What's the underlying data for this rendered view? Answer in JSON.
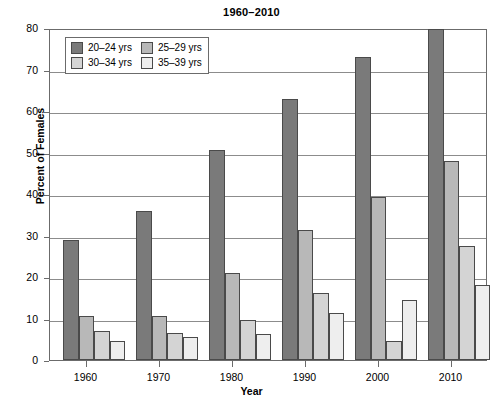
{
  "chart_data": {
    "type": "bar",
    "title": "1960–2010",
    "xlabel": "Year",
    "ylabel": "Percent of Females",
    "categories": [
      "1960",
      "1970",
      "1980",
      "1990",
      "2000",
      "2010"
    ],
    "ylim": [
      0,
      80
    ],
    "yticks": [
      "0",
      "10",
      "20",
      "30",
      "40",
      "50",
      "60",
      "70",
      "80"
    ],
    "grid": "horizontal",
    "legend_position": "top-left inside plot",
    "series": [
      {
        "name": "20–24 yrs",
        "color": "#7a7a7a",
        "values": [
          29,
          36,
          50.5,
          63,
          73,
          79.8
        ]
      },
      {
        "name": "25–29 yrs",
        "color": "#b8b8b8",
        "values": [
          10.5,
          10.5,
          21,
          31.3,
          39.2,
          48
        ]
      },
      {
        "name": "30–34 yrs",
        "color": "#d4d4d4",
        "values": [
          7,
          6.5,
          9.7,
          16.2,
          4.5,
          27.5
        ]
      },
      {
        "name": "35–39 yrs",
        "color": "#eeeeee",
        "values": [
          4.5,
          5.5,
          6.3,
          11.3,
          14.5,
          18
        ]
      }
    ]
  }
}
